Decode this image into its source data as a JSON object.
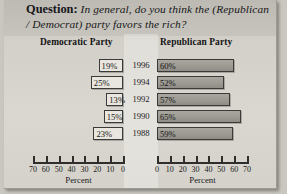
{
  "figure": {
    "question_label": "Question",
    "question_separator": ":",
    "question_text": "In general, do you think the (Republican / Democrat) party favors the rich?"
  },
  "panels": {
    "left_title": "Democratic Party",
    "right_title": "Republican Party"
  },
  "axis": {
    "caption": "Percent",
    "left_ticks": [
      "70",
      "60",
      "50",
      "40",
      "30",
      "20",
      "10",
      "0"
    ],
    "right_ticks": [
      "0",
      "10",
      "20",
      "30",
      "40",
      "50",
      "60",
      "70"
    ]
  },
  "chart_data": {
    "type": "bar",
    "title": "In general, do you think the (Republican / Democrat) party favors the rich?",
    "orientation": "horizontal",
    "categories": [
      "1996",
      "1994",
      "1992",
      "1990",
      "1988"
    ],
    "xlabel": "Percent",
    "ylabel": "",
    "xlim": [
      0,
      70
    ],
    "grid": false,
    "legend": "none",
    "series": [
      {
        "name": "Democratic Party",
        "direction": "left",
        "fill": "#e8e6de",
        "values": [
          19,
          25,
          13,
          15,
          23
        ],
        "labels": [
          "19%",
          "25%",
          "13%",
          "15%",
          "23%"
        ]
      },
      {
        "name": "Republican Party",
        "direction": "right",
        "fill": "#9c9a92",
        "values": [
          60,
          52,
          57,
          65,
          59
        ],
        "labels": [
          "60%",
          "52%",
          "57%",
          "65%",
          "59%"
        ]
      }
    ]
  }
}
